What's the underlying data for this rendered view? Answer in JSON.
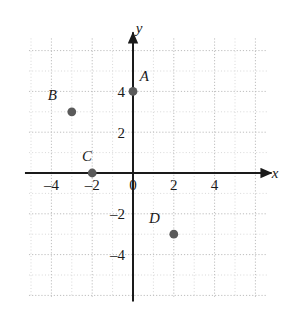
{
  "chart_data": {
    "type": "scatter",
    "title": "",
    "xlabel": "x",
    "ylabel": "y",
    "grid": true,
    "legend": "none",
    "xlim": [
      -5.1,
      6.6
    ],
    "ylim": [
      -6.1,
      6.6
    ],
    "x_ticks": [
      -4,
      -2,
      0,
      2,
      4
    ],
    "y_ticks": [
      4,
      2,
      -2,
      -4
    ],
    "x_tick_labels": [
      "–4",
      "–2",
      "0",
      "2",
      "4"
    ],
    "y_tick_labels": [
      "4",
      "2",
      "–2",
      "–4"
    ],
    "minor_grid_step": 1,
    "major_grid_step": 2,
    "points": [
      {
        "label": "A",
        "x": 0,
        "y": 4,
        "label_dx": 0.55,
        "label_dy": 0.75
      },
      {
        "label": "B",
        "x": -3,
        "y": 3,
        "label_dx": -0.95,
        "label_dy": 0.8
      },
      {
        "label": "C",
        "x": -2,
        "y": 0,
        "label_dx": -0.25,
        "label_dy": 0.85
      },
      {
        "label": "D",
        "x": 2,
        "y": -3,
        "label_dx": -0.95,
        "label_dy": 0.8
      }
    ],
    "colors": {
      "point_fill": "#5a5a5a",
      "axis": "#1a1a1a",
      "minor_grid": "#d8d8d8",
      "major_grid": "#bdbdbd",
      "background": "#ffffff",
      "text": "#1a1a1a"
    }
  },
  "axes": {
    "x_axis_label": "x",
    "y_axis_label": "y"
  }
}
